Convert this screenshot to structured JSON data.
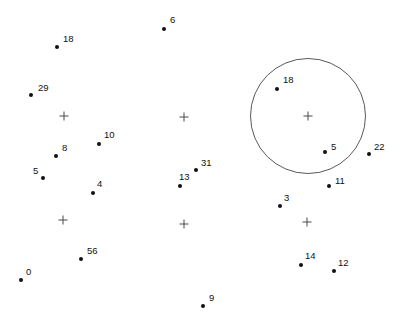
{
  "chart_data": {
    "type": "scatter",
    "title": "",
    "subtitle": "",
    "xlabel": "",
    "ylabel": "",
    "grid": false,
    "legend": "none",
    "axes_visible": false,
    "xlim": [
      0,
      407
    ],
    "ylim": [
      0,
      329
    ],
    "background_color": "#ffffff",
    "point_color": "#111111",
    "label_color": "#111111",
    "marker_color": "#4a4a4a",
    "circle_color": "#5a5a5a",
    "points": [
      {
        "label": "6",
        "x": 164,
        "y": 29,
        "lx": 170,
        "ly": 20
      },
      {
        "label": "18",
        "x": 57,
        "y": 47,
        "lx": 63,
        "ly": 39
      },
      {
        "label": "29",
        "x": 31,
        "y": 95,
        "lx": 38,
        "ly": 88
      },
      {
        "label": "18",
        "x": 277,
        "y": 89,
        "lx": 283,
        "ly": 80
      },
      {
        "label": "10",
        "x": 99,
        "y": 144,
        "lx": 104,
        "ly": 135
      },
      {
        "label": "8",
        "x": 56,
        "y": 156,
        "lx": 62,
        "ly": 148
      },
      {
        "label": "5",
        "x": 325,
        "y": 152,
        "lx": 331,
        "ly": 147
      },
      {
        "label": "22",
        "x": 369,
        "y": 154,
        "lx": 374,
        "ly": 147
      },
      {
        "label": "31",
        "x": 196,
        "y": 170,
        "lx": 201,
        "ly": 163
      },
      {
        "label": "5",
        "x": 43,
        "y": 178,
        "lx": 33,
        "ly": 171
      },
      {
        "label": "11",
        "x": 329,
        "y": 186,
        "lx": 335,
        "ly": 181
      },
      {
        "label": "13",
        "x": 180,
        "y": 186,
        "lx": 179,
        "ly": 177
      },
      {
        "label": "4",
        "x": 93,
        "y": 193,
        "lx": 97,
        "ly": 184
      },
      {
        "label": "3",
        "x": 280,
        "y": 206,
        "lx": 284,
        "ly": 198
      },
      {
        "label": "56",
        "x": 81,
        "y": 259,
        "lx": 87,
        "ly": 251
      },
      {
        "label": "14",
        "x": 301,
        "y": 265,
        "lx": 305,
        "ly": 256
      },
      {
        "label": "12",
        "x": 334,
        "y": 271,
        "lx": 338,
        "ly": 263
      },
      {
        "label": "0",
        "x": 21,
        "y": 280,
        "lx": 26,
        "ly": 272
      },
      {
        "label": "9",
        "x": 203,
        "y": 306,
        "lx": 209,
        "ly": 298
      }
    ],
    "centroids": [
      {
        "name": "centroid-1",
        "x": 64,
        "y": 116
      },
      {
        "name": "centroid-2",
        "x": 184,
        "y": 117
      },
      {
        "name": "centroid-3",
        "x": 308,
        "y": 116
      },
      {
        "name": "centroid-4",
        "x": 63,
        "y": 220
      },
      {
        "name": "centroid-5",
        "x": 184,
        "y": 224
      },
      {
        "name": "centroid-6",
        "x": 307,
        "y": 222
      }
    ],
    "circles": [
      {
        "name": "cluster-boundary-circle",
        "cx": 308,
        "cy": 116,
        "r": 58
      }
    ]
  }
}
